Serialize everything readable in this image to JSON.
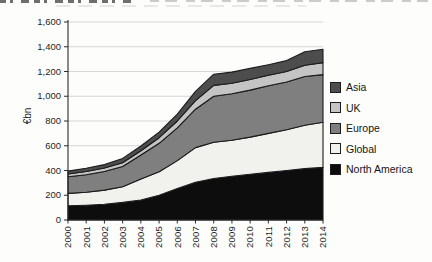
{
  "page": {
    "background": "#fdfdfc"
  },
  "chart_data": {
    "type": "area",
    "stacked": true,
    "title": "",
    "ylabel": "€bn",
    "xlabel": "",
    "grid": "horizontal-only",
    "legend_position": "right",
    "ylim": [
      0,
      1600
    ],
    "y_tick_step": 200,
    "y_tick_labels": [
      "0",
      "200",
      "400",
      "600",
      "800",
      "1,000",
      "1,200",
      "1,400",
      "1,600"
    ],
    "x_labels": [
      "2000",
      "2001",
      "2002",
      "2003",
      "2004",
      "2005",
      "2006",
      "2007",
      "2008",
      "2009",
      "2010",
      "2011",
      "2012",
      "2013",
      "2014"
    ],
    "series": [
      {
        "name": "North America",
        "color": "#0d0d0d",
        "values": [
          115,
          120,
          128,
          142,
          162,
          200,
          255,
          305,
          335,
          353,
          370,
          385,
          400,
          415,
          425
        ]
      },
      {
        "name": "Global",
        "color": "#f1f1ee",
        "values": [
          100,
          105,
          114,
          126,
          170,
          190,
          225,
          280,
          293,
          292,
          300,
          315,
          330,
          350,
          365
        ]
      },
      {
        "name": "Europe",
        "color": "#7f7f7f",
        "values": [
          135,
          140,
          150,
          164,
          193,
          230,
          265,
          310,
          372,
          375,
          380,
          385,
          385,
          395,
          385
        ]
      },
      {
        "name": "UK",
        "color": "#c4c4c4",
        "values": [
          22,
          27,
          28,
          31,
          35,
          45,
          55,
          70,
          88,
          85,
          85,
          85,
          85,
          90,
          97
        ]
      },
      {
        "name": "Asia",
        "color": "#4d4d4d",
        "values": [
          23,
          26,
          28,
          35,
          38,
          45,
          55,
          75,
          90,
          90,
          90,
          85,
          88,
          110,
          108
        ]
      }
    ],
    "legend": [
      {
        "label": "Asia",
        "color": "#4d4d4d"
      },
      {
        "label": "UK",
        "color": "#c4c4c4"
      },
      {
        "label": "Europe",
        "color": "#7f7f7f"
      },
      {
        "label": "Global",
        "color": "#f1f1ee"
      },
      {
        "label": "North America",
        "color": "#0d0d0d"
      }
    ],
    "axis_color": "#2b2b2b",
    "gridline_color": "#cccccc",
    "outline_color": "#1c1c1c"
  }
}
